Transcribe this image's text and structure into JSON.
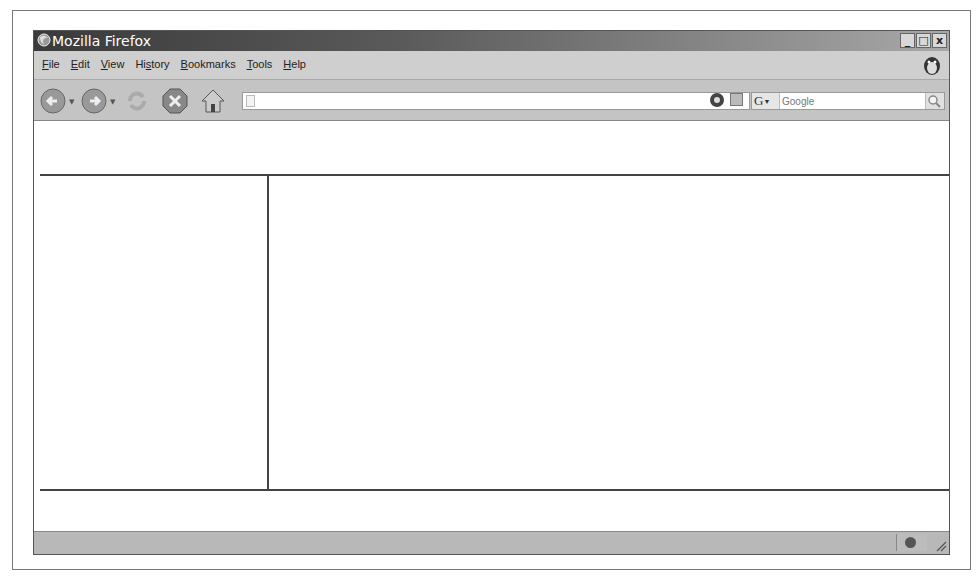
{
  "window": {
    "title": "Mozilla Firefox",
    "controls": {
      "minimize": "_",
      "maximize": "□",
      "close": "x"
    }
  },
  "menubar": {
    "items": [
      {
        "label": "File",
        "accel": "F",
        "rest": "ile"
      },
      {
        "label": "Edit",
        "accel": "E",
        "rest": "dit"
      },
      {
        "label": "View",
        "accel": "V",
        "rest": "iew"
      },
      {
        "label": "History",
        "pre": "Hi",
        "accel": "s",
        "rest": "tory"
      },
      {
        "label": "Bookmarks",
        "accel": "B",
        "rest": "ookmarks"
      },
      {
        "label": "Tools",
        "accel": "T",
        "rest": "ools"
      },
      {
        "label": "Help",
        "accel": "H",
        "rest": "elp"
      }
    ]
  },
  "navbar": {
    "back": "back-icon",
    "forward": "forward-icon",
    "reload": "reload-icon",
    "stop": "stop-icon",
    "home": "home-icon",
    "url": {
      "value": "",
      "placeholder": ""
    },
    "search": {
      "engine": "G",
      "placeholder": "Google"
    }
  },
  "content": {
    "layout": "frameset: top frame, left frame, right frame, bottom frame"
  },
  "statusbar": {
    "text": ""
  }
}
